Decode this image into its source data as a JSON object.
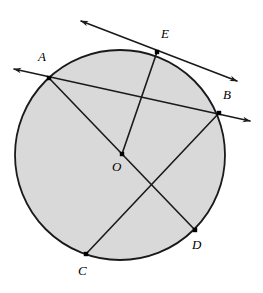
{
  "figure": {
    "kind": "circle-geometry-diagram",
    "width": 263,
    "height": 293,
    "background_color": "#ffffff",
    "stroke_color": "#1a1a1a",
    "fill_color": "#d9d9d9",
    "point_marker_color": "#000000"
  },
  "circle": {
    "label": "O",
    "center_x": 120,
    "center_y": 155,
    "radius": 105,
    "fill": "#d9d9d9",
    "stroke": "#1a1a1a",
    "stroke_width": 1.8
  },
  "points": [
    {
      "id": "A",
      "label": "A",
      "x": 49,
      "y": 78,
      "label_x": 38,
      "label_y": 50,
      "on_circle": true
    },
    {
      "id": "B",
      "label": "B",
      "x": 219,
      "y": 113,
      "label_x": 223,
      "label_y": 88,
      "on_circle": true
    },
    {
      "id": "C",
      "label": "C",
      "x": 86,
      "y": 254,
      "label_x": 78,
      "label_y": 264,
      "on_circle": true
    },
    {
      "id": "D",
      "label": "D",
      "x": 195,
      "y": 230,
      "label_x": 192,
      "label_y": 238,
      "on_circle": true
    },
    {
      "id": "E",
      "label": "E",
      "x": 157,
      "y": 52,
      "label_x": 161,
      "label_y": 27,
      "on_circle": true
    },
    {
      "id": "O",
      "label": "O",
      "x": 122,
      "y": 154,
      "label_x": 112,
      "label_y": 160,
      "on_circle": false
    }
  ],
  "lines": [
    {
      "id": "line-AB",
      "name": "secant-line-through-A-and-B",
      "x1": 14,
      "y1": 69,
      "x2": 250,
      "y2": 121,
      "arrow_start": true,
      "arrow_end": true,
      "through": [
        "A",
        "B"
      ]
    },
    {
      "id": "line-E",
      "name": "tangent-line-at-E",
      "x1": 81,
      "y1": 21,
      "x2": 237,
      "y2": 81,
      "arrow_start": true,
      "arrow_end": true,
      "through": [
        "E"
      ]
    },
    {
      "id": "segment-OA",
      "name": "radius-O-to-A",
      "x1": 122,
      "y1": 154,
      "x2": 49,
      "y2": 78,
      "arrow_start": false,
      "arrow_end": false,
      "through": [
        "O",
        "A"
      ]
    },
    {
      "id": "segment-OE",
      "name": "radius-O-to-E",
      "x1": 122,
      "y1": 154,
      "x2": 157,
      "y2": 52,
      "arrow_start": false,
      "arrow_end": false,
      "through": [
        "O",
        "E"
      ]
    },
    {
      "id": "segment-OD",
      "name": "radius-O-to-D",
      "x1": 122,
      "y1": 154,
      "x2": 195,
      "y2": 230,
      "arrow_start": false,
      "arrow_end": false,
      "through": [
        "O",
        "D"
      ]
    },
    {
      "id": "segment-CB",
      "name": "chord-C-to-B",
      "x1": 86,
      "y1": 254,
      "x2": 219,
      "y2": 113,
      "arrow_start": false,
      "arrow_end": false,
      "through": [
        "C",
        "B"
      ]
    }
  ]
}
